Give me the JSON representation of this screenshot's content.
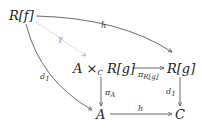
{
  "diagram": {
    "type": "commutative-diagram",
    "nodes": {
      "Rf": "R[f]",
      "pullback_A": "A ×",
      "pullback_C": "C",
      "pullback_Rg": "R[g]",
      "Rg": "R[g]",
      "A": "A",
      "C": "C"
    },
    "arrows": {
      "h_tilde": "h̃",
      "gamma": "γ",
      "pi_Rg_pi": "π",
      "pi_Rg_sub": "R[g]",
      "pi_A_pi": "π",
      "pi_A_sub": "A",
      "d1_left_d": "d",
      "d1_left_sub": "1",
      "d1_right_d": "d",
      "d1_right_sub": "1",
      "h": "h"
    },
    "colors": {
      "arrow": "#444444",
      "gamma_arrow": "#aaaaaa"
    }
  }
}
